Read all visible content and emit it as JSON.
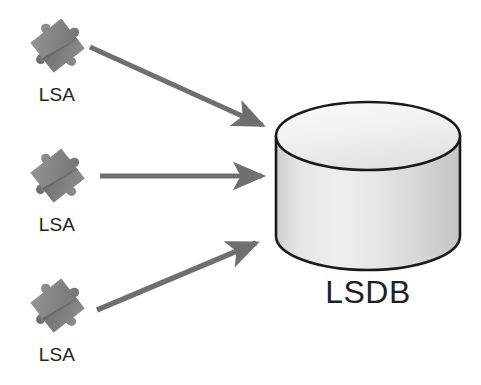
{
  "diagram": {
    "type": "flow-diagram",
    "canvas": {
      "width": 481,
      "height": 385,
      "background": "#ffffff"
    },
    "colors": {
      "arrow": "#6f6f70",
      "text": "#231f20",
      "outline": "#1a1a1a",
      "puzzle_light": "#8e8e8e",
      "puzzle_mid": "#767676",
      "puzzle_dark": "#5e5e5e",
      "cylinder_top": "#f2f2f2",
      "cylinder_body_light": "#f0f0f0",
      "cylinder_body_dark": "#c2c2c2"
    },
    "nodes": [
      {
        "id": "lsa-1",
        "icon": "puzzle-piece-icon",
        "label": "LSA",
        "x": 24,
        "y": 12,
        "label_x": 14,
        "label_y": 84
      },
      {
        "id": "lsa-2",
        "icon": "puzzle-piece-icon",
        "label": "LSA",
        "x": 24,
        "y": 142,
        "label_x": 14,
        "label_y": 214
      },
      {
        "id": "lsa-3",
        "icon": "puzzle-piece-icon",
        "label": "LSA",
        "x": 24,
        "y": 272,
        "label_x": 14,
        "label_y": 344
      },
      {
        "id": "lsdb",
        "icon": "database-cylinder-icon",
        "label": "LSDB",
        "x": 275,
        "y": 100,
        "width": 186,
        "height": 170,
        "label_x": 268,
        "label_y": 274
      }
    ],
    "edges": [
      {
        "id": "edge-lsa1-lsdb",
        "from": "lsa-1",
        "to": "lsdb",
        "x1": 90,
        "y1": 47,
        "x2": 268,
        "y2": 128,
        "label": ""
      },
      {
        "id": "edge-lsa2-lsdb",
        "from": "lsa-2",
        "to": "lsdb",
        "x1": 100,
        "y1": 176,
        "x2": 268,
        "y2": 176,
        "label": ""
      },
      {
        "id": "edge-lsa3-lsdb",
        "from": "lsa-3",
        "to": "lsdb",
        "x1": 97,
        "y1": 310,
        "x2": 262,
        "y2": 240,
        "label": ""
      }
    ]
  }
}
